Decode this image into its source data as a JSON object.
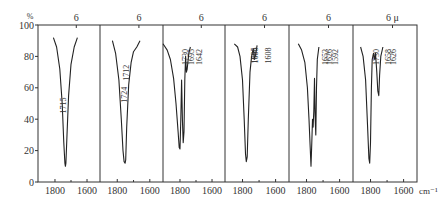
{
  "chart_data": {
    "type": "line",
    "title": "",
    "ylabel": "%",
    "xlabel": "cm⁻¹",
    "top_axis_unit": "μ",
    "ylim": [
      0,
      100
    ],
    "yticks": [
      0,
      20,
      40,
      60,
      80,
      100
    ],
    "xlim": [
      1906,
      1519
    ],
    "xticks": [
      1800,
      1600
    ],
    "grid": false,
    "panels": [
      {
        "top_label": "6",
        "peaks": [
          {
            "wavenumber": 1715,
            "label": "1715"
          }
        ],
        "points": [
          [
            1810,
            92
          ],
          [
            1790,
            86
          ],
          [
            1770,
            72
          ],
          [
            1755,
            50
          ],
          [
            1745,
            25
          ],
          [
            1738,
            12
          ],
          [
            1735,
            10
          ],
          [
            1732,
            12
          ],
          [
            1725,
            30
          ],
          [
            1715,
            55
          ],
          [
            1700,
            75
          ],
          [
            1680,
            86
          ],
          [
            1660,
            92
          ]
        ]
      },
      {
        "top_label": "6",
        "peaks": [
          {
            "wavenumber": 1724,
            "label": "1724"
          },
          {
            "wavenumber": 1712,
            "label": "1712"
          }
        ],
        "points": [
          [
            1830,
            90
          ],
          [
            1810,
            82
          ],
          [
            1790,
            65
          ],
          [
            1775,
            40
          ],
          [
            1765,
            20
          ],
          [
            1758,
            13
          ],
          [
            1752,
            12
          ],
          [
            1748,
            14
          ],
          [
            1742,
            35
          ],
          [
            1730,
            62
          ],
          [
            1715,
            76
          ],
          [
            1700,
            83
          ],
          [
            1680,
            86
          ],
          [
            1660,
            90
          ]
        ]
      },
      {
        "top_label": "6",
        "peaks": [
          {
            "wavenumber": 1730,
            "label": "1730"
          },
          {
            "wavenumber": 1695,
            "label": "1695"
          },
          {
            "wavenumber": 1642,
            "label": "1642"
          }
        ],
        "points": [
          [
            1906,
            88
          ],
          [
            1880,
            84
          ],
          [
            1860,
            78
          ],
          [
            1840,
            66
          ],
          [
            1825,
            50
          ],
          [
            1812,
            32
          ],
          [
            1805,
            22
          ],
          [
            1800,
            21
          ],
          [
            1795,
            40
          ],
          [
            1790,
            65
          ],
          [
            1785,
            40
          ],
          [
            1780,
            25
          ],
          [
            1775,
            32
          ],
          [
            1770,
            65
          ],
          [
            1765,
            80
          ],
          [
            1760,
            70
          ],
          [
            1755,
            72
          ],
          [
            1745,
            82
          ],
          [
            1735,
            86
          ]
        ]
      },
      {
        "top_label": "6",
        "peaks": [
          {
            "wavenumber": 1695,
            "label": "1695"
          },
          {
            "wavenumber": 1686,
            "label": "1686"
          },
          {
            "wavenumber": 1608,
            "label": "1608"
          }
        ],
        "points": [
          [
            1850,
            88
          ],
          [
            1830,
            86
          ],
          [
            1815,
            80
          ],
          [
            1800,
            65
          ],
          [
            1790,
            40
          ],
          [
            1782,
            18
          ],
          [
            1777,
            13
          ],
          [
            1772,
            16
          ],
          [
            1765,
            40
          ],
          [
            1755,
            70
          ],
          [
            1745,
            80
          ],
          [
            1735,
            85
          ],
          [
            1728,
            78
          ],
          [
            1720,
            82
          ],
          [
            1712,
            87
          ]
        ]
      },
      {
        "top_label": "6",
        "peaks": [
          {
            "wavenumber": 1653,
            "label": "1653"
          },
          {
            "wavenumber": 1626,
            "label": "1626"
          },
          {
            "wavenumber": 1592,
            "label": "1592"
          }
        ],
        "points": [
          [
            1850,
            88
          ],
          [
            1830,
            84
          ],
          [
            1810,
            76
          ],
          [
            1795,
            60
          ],
          [
            1785,
            40
          ],
          [
            1778,
            22
          ],
          [
            1773,
            10
          ],
          [
            1768,
            25
          ],
          [
            1764,
            40
          ],
          [
            1760,
            35
          ],
          [
            1756,
            45
          ],
          [
            1752,
            66
          ],
          [
            1748,
            42
          ],
          [
            1744,
            30
          ],
          [
            1740,
            60
          ],
          [
            1735,
            78
          ],
          [
            1725,
            86
          ]
        ]
      },
      {
        "top_label": "6",
        "peaks": [
          {
            "wavenumber": 1730,
            "label": "1730"
          },
          {
            "wavenumber": 1658,
            "label": "1658"
          },
          {
            "wavenumber": 1626,
            "label": "1626"
          }
        ],
        "points": [
          [
            1860,
            86
          ],
          [
            1845,
            80
          ],
          [
            1830,
            65
          ],
          [
            1818,
            35
          ],
          [
            1810,
            15
          ],
          [
            1805,
            12
          ],
          [
            1800,
            25
          ],
          [
            1795,
            60
          ],
          [
            1790,
            78
          ],
          [
            1782,
            82
          ],
          [
            1775,
            78
          ],
          [
            1770,
            82
          ],
          [
            1762,
            70
          ],
          [
            1756,
            58
          ],
          [
            1750,
            55
          ],
          [
            1745,
            68
          ],
          [
            1738,
            80
          ],
          [
            1725,
            86
          ]
        ]
      }
    ]
  }
}
